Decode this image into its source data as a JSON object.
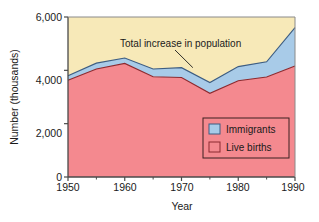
{
  "chart_data": {
    "type": "area",
    "title": "",
    "subtitle": "",
    "xlabel": "Year",
    "ylabel": "Number (thousands)",
    "xlim": [
      1950,
      1990
    ],
    "ylim": [
      0,
      6000
    ],
    "grid": false,
    "stacked": true,
    "legend_position": "inside-lower-right",
    "x": [
      1950,
      1955,
      1960,
      1965,
      1970,
      1975,
      1980,
      1985,
      1990
    ],
    "xticks": [
      1950,
      1960,
      1970,
      1980,
      1990
    ],
    "xtick_labels": [
      "1950",
      "1960",
      "1970",
      "1980",
      "1990"
    ],
    "xminor_ticks": [
      1955,
      1965,
      1975,
      1985
    ],
    "yticks": [
      0,
      2000,
      4000,
      6000
    ],
    "ytick_labels": [
      "0",
      "2,000",
      "4,000",
      "6,000"
    ],
    "series": [
      {
        "name": "Live births",
        "color": "#f4898f",
        "edge_color": "#8c2a30",
        "values": [
          3630,
          4050,
          4260,
          3760,
          3730,
          3140,
          3610,
          3750,
          4160
        ]
      },
      {
        "name": "Immigrants",
        "color": "#a8cbe8",
        "edge_color": "#3d5d82",
        "values": [
          170,
          220,
          200,
          290,
          370,
          400,
          530,
          570,
          1440
        ]
      }
    ],
    "totals": {
      "name": "Total increase in population",
      "values": [
        3800,
        4270,
        4460,
        4050,
        4100,
        3540,
        4140,
        4320,
        5600
      ]
    },
    "background_band_color": "#f7e9b8",
    "annotations": [
      {
        "text": "Total increase in population",
        "target_x": 1972,
        "target_y": 4100
      }
    ],
    "legend": [
      {
        "label": "Immigrants",
        "swatch_fill": "#a8cbe8",
        "swatch_stroke": "#3d5d82"
      },
      {
        "label": "Live births",
        "swatch_fill": "#f4898f",
        "swatch_stroke": "#8c2a30"
      }
    ]
  }
}
